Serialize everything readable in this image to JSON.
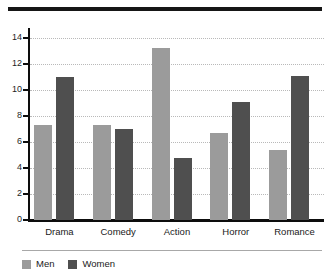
{
  "chart_data": {
    "type": "bar",
    "title": "",
    "subtitle": "",
    "xlabel": "",
    "ylabel": "",
    "categories": [
      "Drama",
      "Comedy",
      "Action",
      "Horror",
      "Romance"
    ],
    "series": [
      {
        "name": "Men",
        "color": "#9b9b9b",
        "values": [
          7.3,
          7.3,
          13.2,
          6.7,
          5.4
        ]
      },
      {
        "name": "Women",
        "color": "#4f4f4f",
        "values": [
          11.0,
          7.0,
          4.8,
          9.1,
          11.1
        ]
      }
    ],
    "ylim": [
      0,
      14
    ],
    "ytick_labels": [
      "0",
      "2",
      "4",
      "6",
      "8",
      "10",
      "12",
      "14"
    ],
    "ytick_values": [
      0,
      2,
      4,
      6,
      8,
      10,
      12,
      14
    ],
    "grid": true,
    "grid_axis": "y",
    "grid_style": "dotted",
    "grid_color": "#b9b9b9",
    "legend": true,
    "legend_position": "bottom-left",
    "legend_entries": [
      "Men",
      "Women"
    ],
    "axis_color": "#0d0d0d",
    "background": "#ffffff",
    "top_rule": true,
    "top_rule_color": "#161616",
    "legend_rule_color": "#a8a8a8"
  }
}
